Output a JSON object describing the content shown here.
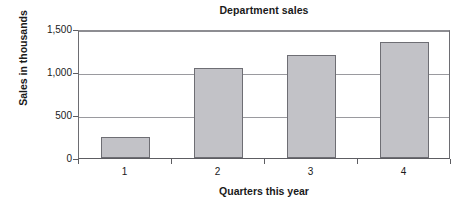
{
  "chart_data": {
    "type": "bar",
    "title": "Department sales",
    "xlabel": "Quarters this year",
    "ylabel": "Sales in thousands",
    "categories": [
      "1",
      "2",
      "3",
      "4"
    ],
    "values": [
      240,
      1050,
      1200,
      1350
    ],
    "ylim": [
      0,
      1500
    ],
    "yticks": [
      0,
      500,
      1000,
      1500
    ],
    "ytick_labels": [
      "0",
      "500",
      "1,000",
      "1,500"
    ],
    "grid": "horizontal",
    "legend": "none",
    "bar_fill_color": "#c2c2c7",
    "bar_border_color": "#6e6e74",
    "axis_color": "#5d5d62",
    "gridline_color": "#9a9a9f",
    "background_color": "#ffffff",
    "series": [
      {
        "name": "Department sales",
        "values": [
          240,
          1050,
          1200,
          1350
        ]
      }
    ]
  }
}
